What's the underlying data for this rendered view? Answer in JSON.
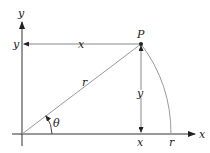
{
  "diagram": {
    "labels": {
      "y_axis": "y",
      "x_axis": "x",
      "point": "P",
      "y_left": "y",
      "x_top": "x",
      "radius_mid": "r",
      "y_vertical": "y",
      "x_bottom": "x",
      "r_bottom": "r",
      "angle": "θ"
    },
    "colors": {
      "axis": "#333333",
      "line": "#888888",
      "text": "#222222"
    }
  }
}
